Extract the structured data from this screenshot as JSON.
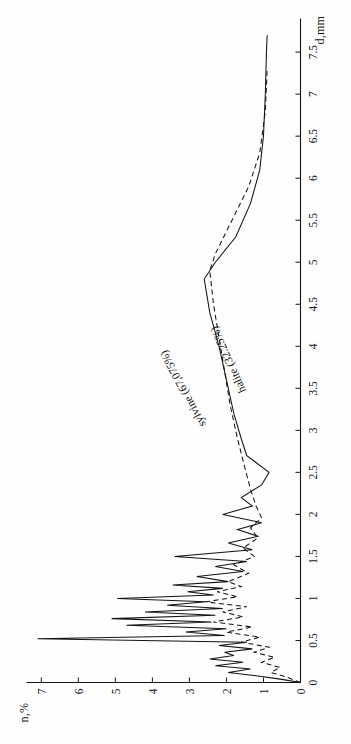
{
  "figure": {
    "orientation": "rotated-90-ccw",
    "background_color": "#fefefe",
    "ink_color": "#141414"
  },
  "axis": {
    "x_title": "d,mm",
    "y_title": "n,%",
    "x_ticks": [
      "0",
      "0.5",
      "1",
      "1.5",
      "2",
      "2.5",
      "3",
      "3.5",
      "4",
      "4.5",
      "5",
      "5.5",
      "6",
      "6.5",
      "7",
      "7.5"
    ],
    "y_ticks": [
      "0",
      "1",
      "2",
      "3",
      "4",
      "5",
      "6",
      "7"
    ]
  },
  "legend": {
    "sylvine_label": "sylvine (67,075%)",
    "halite_label": "halite (32.25%)"
  },
  "chart_data": {
    "type": "line",
    "title": "",
    "subtitle": "",
    "xlabel": "d,mm",
    "ylabel": "n,%",
    "xlim": [
      0,
      7.9
    ],
    "ylim": [
      0,
      7.4
    ],
    "grid": false,
    "legend_position": "inline-annotation",
    "xticks": [
      0,
      0.5,
      1,
      1.5,
      2,
      2.5,
      3,
      3.5,
      4,
      4.5,
      5,
      5.5,
      6,
      6.5,
      7,
      7.5
    ],
    "yticks": [
      0,
      1,
      2,
      3,
      4,
      5,
      6,
      7
    ],
    "series": [
      {
        "name": "sylvine (67,075%)",
        "style": "solid",
        "color": "#141414",
        "points": [
          [
            0.0,
            0.0
          ],
          [
            0.04,
            0.55
          ],
          [
            0.08,
            1.2
          ],
          [
            0.12,
            1.95
          ],
          [
            0.16,
            1.35
          ],
          [
            0.2,
            2.3
          ],
          [
            0.24,
            1.55
          ],
          [
            0.28,
            2.45
          ],
          [
            0.32,
            1.8
          ],
          [
            0.36,
            2.05
          ],
          [
            0.4,
            1.3
          ],
          [
            0.44,
            2.2
          ],
          [
            0.48,
            1.45
          ],
          [
            0.52,
            7.1
          ],
          [
            0.56,
            2.05
          ],
          [
            0.6,
            3.1
          ],
          [
            0.64,
            2.0
          ],
          [
            0.68,
            4.7
          ],
          [
            0.72,
            2.4
          ],
          [
            0.76,
            5.1
          ],
          [
            0.8,
            2.3
          ],
          [
            0.84,
            4.2
          ],
          [
            0.88,
            2.1
          ],
          [
            0.92,
            3.6
          ],
          [
            0.96,
            2.55
          ],
          [
            1.0,
            4.95
          ],
          [
            1.04,
            2.35
          ],
          [
            1.08,
            3.05
          ],
          [
            1.12,
            2.1
          ],
          [
            1.16,
            3.45
          ],
          [
            1.2,
            1.95
          ],
          [
            1.26,
            2.8
          ],
          [
            1.32,
            1.55
          ],
          [
            1.38,
            2.3
          ],
          [
            1.44,
            1.45
          ],
          [
            1.5,
            3.4
          ],
          [
            1.58,
            1.3
          ],
          [
            1.66,
            1.95
          ],
          [
            1.74,
            1.15
          ],
          [
            1.82,
            1.7
          ],
          [
            1.9,
            1.05
          ],
          [
            2.0,
            2.1
          ],
          [
            2.1,
            1.3
          ],
          [
            2.2,
            1.6
          ],
          [
            2.35,
            1.05
          ],
          [
            2.5,
            0.85
          ],
          [
            2.7,
            1.45
          ],
          [
            2.9,
            1.6
          ],
          [
            3.2,
            1.8
          ],
          [
            3.6,
            2.0
          ],
          [
            4.0,
            2.2
          ],
          [
            4.4,
            2.45
          ],
          [
            4.8,
            2.6
          ],
          [
            5.0,
            2.3
          ],
          [
            5.3,
            1.75
          ],
          [
            5.7,
            1.35
          ],
          [
            6.1,
            1.1
          ],
          [
            6.5,
            1.0
          ],
          [
            7.0,
            0.95
          ],
          [
            7.5,
            0.92
          ],
          [
            7.7,
            0.9
          ]
        ]
      },
      {
        "name": "halite (32.25%)",
        "style": "dashed",
        "color": "#141414",
        "points": [
          [
            0.0,
            0.0
          ],
          [
            0.06,
            0.35
          ],
          [
            0.12,
            0.8
          ],
          [
            0.18,
            0.55
          ],
          [
            0.24,
            1.05
          ],
          [
            0.3,
            0.7
          ],
          [
            0.36,
            1.25
          ],
          [
            0.42,
            0.85
          ],
          [
            0.48,
            1.6
          ],
          [
            0.54,
            1.1
          ],
          [
            0.6,
            2.0
          ],
          [
            0.66,
            1.3
          ],
          [
            0.72,
            2.35
          ],
          [
            0.78,
            1.55
          ],
          [
            0.84,
            2.1
          ],
          [
            0.9,
            1.45
          ],
          [
            0.96,
            2.55
          ],
          [
            1.02,
            1.7
          ],
          [
            1.08,
            2.25
          ],
          [
            1.14,
            1.6
          ],
          [
            1.2,
            1.95
          ],
          [
            1.3,
            1.4
          ],
          [
            1.4,
            1.8
          ],
          [
            1.5,
            1.25
          ],
          [
            1.6,
            1.55
          ],
          [
            1.72,
            1.15
          ],
          [
            1.84,
            1.35
          ],
          [
            1.96,
            1.05
          ],
          [
            2.1,
            1.2
          ],
          [
            2.3,
            1.35
          ],
          [
            2.55,
            1.5
          ],
          [
            2.9,
            1.7
          ],
          [
            3.3,
            1.9
          ],
          [
            3.7,
            2.05
          ],
          [
            4.1,
            2.2
          ],
          [
            4.5,
            2.35
          ],
          [
            4.9,
            2.45
          ],
          [
            5.1,
            2.3
          ],
          [
            5.5,
            1.85
          ],
          [
            5.9,
            1.4
          ],
          [
            6.3,
            1.1
          ],
          [
            6.8,
            0.95
          ],
          [
            7.3,
            0.9
          ]
        ]
      }
    ]
  }
}
